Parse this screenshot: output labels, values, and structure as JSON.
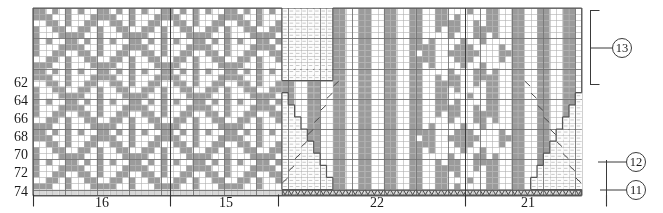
{
  "chart_data": {
    "type": "heatmap",
    "title": "",
    "subtitle": "",
    "xlabel": "",
    "ylabel": "",
    "grid": {
      "columns": 86,
      "rows": 31,
      "cell_width": 6.38,
      "cell_height": 6.05,
      "origin_x": 33,
      "origin_y": 8
    },
    "colors": {
      "filled": "#9b9b9b",
      "empty": "#ffffff",
      "no_stitch": "#fdfdfd",
      "no_stitch_dot": "#c9c9c9",
      "gridline": "#b0b0b0",
      "gridline_major": "#6d6d6d",
      "outline": "#555555",
      "symbol": "#4a4a4a",
      "text": "#1a1a1a"
    },
    "row_labels": [
      {
        "text": "62",
        "y": 83
      },
      {
        "text": "64",
        "y": 101
      },
      {
        "text": "66",
        "y": 119
      },
      {
        "text": "68",
        "y": 137
      },
      {
        "text": "70",
        "y": 155
      },
      {
        "text": "72",
        "y": 173
      },
      {
        "text": "74",
        "y": 192
      }
    ],
    "column_labels": [
      {
        "text": "16",
        "x": 102
      },
      {
        "text": "15",
        "x": 226
      },
      {
        "text": "22",
        "x": 377
      },
      {
        "text": "21",
        "x": 528
      }
    ],
    "section_dividers_x": [
      33,
      170,
      278,
      465,
      606
    ],
    "callouts": [
      {
        "text": "13",
        "x": 612,
        "y": 38,
        "leader_x1": 590,
        "leader_y1": 48,
        "leader_x2": 612,
        "leader_y2": 48,
        "bracket": {
          "x": 590,
          "y_top": 10,
          "y_bottom": 85
        }
      },
      {
        "text": "12",
        "x": 626,
        "y": 152,
        "leader_x1": 598,
        "leader_y1": 162,
        "leader_x2": 626,
        "leader_y2": 162
      },
      {
        "text": "11",
        "x": 626,
        "y": 180,
        "leader_x1": 600,
        "leader_y1": 190,
        "leader_x2": 626,
        "leader_y2": 190
      }
    ],
    "legend": [
      {
        "symbol": "filled",
        "label": "main color stitch"
      },
      {
        "symbol": "empty",
        "label": "contrast color stitch"
      },
      {
        "symbol": "diagonal",
        "label": "decrease"
      },
      {
        "symbol": "V",
        "label": "slip stitch"
      },
      {
        "symbol": "dotted",
        "label": "no stitch"
      }
    ],
    "bottom_symbol_row": {
      "symbol": "V",
      "label": "slip stitch row",
      "row_index": 30,
      "start_col": 39,
      "end_col": 86
    },
    "left_panel": {
      "start_col": 0,
      "end_col": 38,
      "motif": "argyle-diamond-lattice",
      "period_x": 10,
      "period_y": 10
    },
    "right_panel": {
      "start_col": 39,
      "end_col": 86,
      "motif": "vertical-stripes-with-diamond",
      "stripe_period": 4,
      "diamond_center_col": 67
    },
    "no_stitch_region": {
      "start_col": 39,
      "end_col": 46,
      "start_row": 0,
      "end_row": 11
    },
    "left_staircase": [
      {
        "row": 12,
        "col": 47
      },
      {
        "row": 14,
        "col": 46
      },
      {
        "row": 16,
        "col": 45
      },
      {
        "row": 18,
        "col": 44
      },
      {
        "row": 20,
        "col": 43
      },
      {
        "row": 22,
        "col": 42
      },
      {
        "row": 24,
        "col": 41
      },
      {
        "row": 26,
        "col": 40
      },
      {
        "row": 28,
        "col": 39
      }
    ],
    "right_staircase": [
      {
        "row": 12,
        "col": 84
      },
      {
        "row": 14,
        "col": 85
      },
      {
        "row": 16,
        "col": 86
      },
      {
        "row": 18,
        "col": 87
      },
      {
        "row": 20,
        "col": 88
      },
      {
        "row": 22,
        "col": 89
      },
      {
        "row": 24,
        "col": 90
      },
      {
        "row": 26,
        "col": 91
      },
      {
        "row": 28,
        "col": 92
      }
    ]
  }
}
